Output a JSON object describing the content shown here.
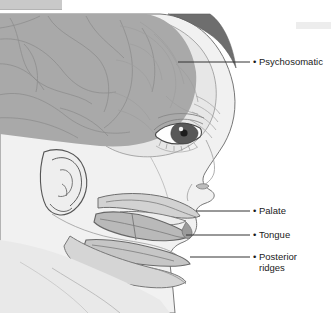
{
  "figure": {
    "type": "anatomical-illustration",
    "view": "lateral-profile-right-facing",
    "colors": {
      "background": "#ffffff",
      "brain_fill": "#a8a8a8",
      "skull_fill": "#e4e4e4",
      "skin_fill": "#f0f0f0",
      "hair_fill": "#6e6e6e",
      "neck_fill": "#d8d8d8",
      "tongue_fill": "#b9b9b9",
      "palate_fill": "#cfcfcf",
      "jaw_fill": "#c4c4c4",
      "outline": "#6b6b6b",
      "leader_line": "#3a3a3a",
      "label_text": "#1a1a1a",
      "top_bar": "#c9c9c9",
      "top_right_bar": "#ededed"
    }
  },
  "chrome": {
    "top_bar_label": "",
    "top_right_bar_label": ""
  },
  "callouts": [
    {
      "id": "psychosomatic",
      "bullet": "•",
      "label": "Psychosomatic",
      "text_x": 257,
      "text_y": 58,
      "leader_x1": 178,
      "leader_x2": 250,
      "leader_y": 62
    },
    {
      "id": "palate",
      "bullet": "•",
      "label": "Palate",
      "text_x": 257,
      "text_y": 207,
      "leader_x1": 196,
      "leader_x2": 250,
      "leader_y": 211
    },
    {
      "id": "tongue",
      "bullet": "•",
      "label": "Tongue",
      "text_x": 257,
      "text_y": 231,
      "leader_x1": 186,
      "leader_x2": 250,
      "leader_y": 235
    },
    {
      "id": "posterior-ridges",
      "bullet": "•",
      "label": "Posterior\nridges",
      "text_x": 257,
      "text_y": 253,
      "leader_x1": 190,
      "leader_x2": 250,
      "leader_y": 257
    }
  ]
}
